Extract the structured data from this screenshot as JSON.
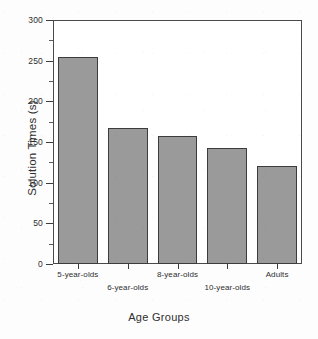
{
  "chart_data": {
    "type": "bar",
    "title": "",
    "xlabel": "Age Groups",
    "ylabel": "Solution Times (s)",
    "categories": [
      "5-year-olds",
      "6-year-olds",
      "8-year-olds",
      "10-year-olds",
      "Adults"
    ],
    "values": [
      255,
      167,
      157,
      143,
      120
    ],
    "ylim": [
      0,
      300
    ],
    "y_major_ticks": [
      0,
      50,
      100,
      150,
      200,
      250,
      300
    ],
    "y_tick_labels": [
      "0",
      "50",
      "100",
      "150",
      "200",
      "250",
      "300"
    ],
    "y_minor_ticks": [
      25,
      75,
      125,
      175,
      225,
      275
    ],
    "grid": false,
    "legend": "none",
    "bar_fill_color": "#9a9a9a",
    "bar_edge_color": "#3c3c3c",
    "axis_color": "#4a4a4a",
    "background_color": "#ffffff"
  }
}
